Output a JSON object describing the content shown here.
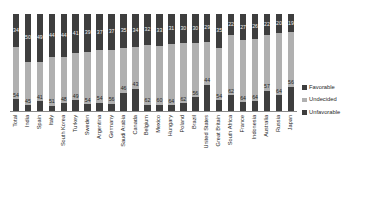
{
  "chart_data": {
    "type": "bar",
    "subtype": "stacked-vertical-100",
    "title": "",
    "subtitle": "",
    "xlabel": "",
    "ylabel": "",
    "ylim": [
      0,
      100
    ],
    "grid": false,
    "legend_position": "right",
    "categories": [
      "Total",
      "India",
      "Spain",
      "Italy",
      "South Korea",
      "Turkey",
      "Sweden",
      "Argentina",
      "Germany",
      "Saudi Arabia",
      "Canada",
      "Belgium",
      "Mexico",
      "Hungary",
      "Poland",
      "Brazil",
      "United States",
      "Great Britain",
      "South Africa",
      "France",
      "Indonesia",
      "Australia",
      "Russia",
      "Japan"
    ],
    "series": [
      {
        "name": "Favorable",
        "color": "#3e3e3e",
        "values": [
          12,
          6,
          10,
          5,
          8,
          11,
          7,
          8,
          7,
          19,
          23,
          6,
          6,
          6,
          8,
          14,
          27,
          11,
          16,
          9,
          10,
          21,
          16,
          25
        ]
      },
      {
        "name": "Undecided",
        "color": "#b0b0b0",
        "values": [
          54,
          45,
          41,
          51,
          48,
          49,
          54,
          54,
          56,
          46,
          43,
          62,
          60,
          64,
          62,
          56,
          44,
          54,
          62,
          64,
          64,
          57,
          64,
          56
        ]
      },
      {
        "name": "Unfavorable",
        "color": "#3e3e3e",
        "values": [
          34,
          50,
          49,
          44,
          44,
          41,
          39,
          37,
          37,
          35,
          34,
          32,
          33,
          31,
          30,
          30,
          29,
          35,
          22,
          27,
          26,
          22,
          20,
          19
        ]
      }
    ]
  },
  "legend": {
    "items": [
      {
        "label": "Favorable",
        "swatch_class": "sw-favorable"
      },
      {
        "label": "Undecided",
        "swatch_class": "sw-undecided"
      },
      {
        "label": "Unfavorable",
        "swatch_class": "sw-unfavorable"
      }
    ]
  }
}
